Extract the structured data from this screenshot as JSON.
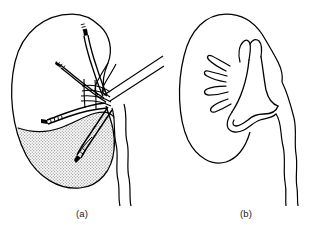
{
  "figure": {
    "background_color": "#ffffff",
    "ink_color": "#000000",
    "stipple_color": "#9a9a9a",
    "width": 328,
    "height": 235,
    "type": "medical-line-illustration"
  },
  "panels": [
    {
      "id": "a",
      "caption": "(a)",
      "description": "Kidney with hilar vessels and branching arterial segments; inferior segment shown stippled",
      "features": [
        "kidney-outline",
        "renal-artery-branches",
        "renal-vein",
        "ureter",
        "stippled-inferior-segment"
      ]
    },
    {
      "id": "b",
      "caption": "(b)",
      "description": "Kidney outline with collecting system: calyces, renal pelvis and ureter",
      "features": [
        "kidney-outline",
        "minor-calyces",
        "major-calyx",
        "renal-pelvis",
        "ureter"
      ]
    }
  ]
}
